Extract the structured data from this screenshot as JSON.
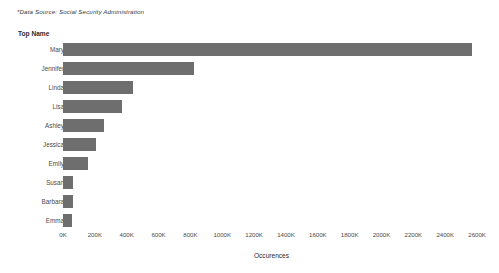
{
  "source_note": "*Data Source: Social Security Administration",
  "dimension_header": "Top Name",
  "colors": {
    "bar": "#6e6e6e",
    "background": "#ffffff",
    "text": "#4a4a4a"
  },
  "chart_data": {
    "type": "bar",
    "orientation": "horizontal",
    "title": "",
    "subtitle": "",
    "xlabel": "Occurences",
    "ylabel": "Top Name",
    "categories": [
      "Mary",
      "Jennifer",
      "Linda",
      "Lisa",
      "Ashley",
      "Jessica",
      "Emily",
      "Susan",
      "Barbara",
      "Emma"
    ],
    "values": [
      2570000,
      820000,
      440000,
      370000,
      260000,
      210000,
      160000,
      65000,
      62000,
      58000
    ],
    "value_unit": "occurrences",
    "xlim": [
      0,
      2700000
    ],
    "tick_values": [
      0,
      200000,
      400000,
      600000,
      800000,
      1000000,
      1200000,
      1400000,
      1600000,
      1800000,
      2000000,
      2200000,
      2400000,
      2600000
    ],
    "tick_labels": [
      "0K",
      "200K",
      "400K",
      "600K",
      "800K",
      "1000K",
      "1200K",
      "1400K",
      "1600K",
      "1800K",
      "2000K",
      "2200K",
      "2400K",
      "2600K"
    ],
    "grid": false,
    "legend": false,
    "annotation": "*Data Source: Social Security Administration"
  }
}
